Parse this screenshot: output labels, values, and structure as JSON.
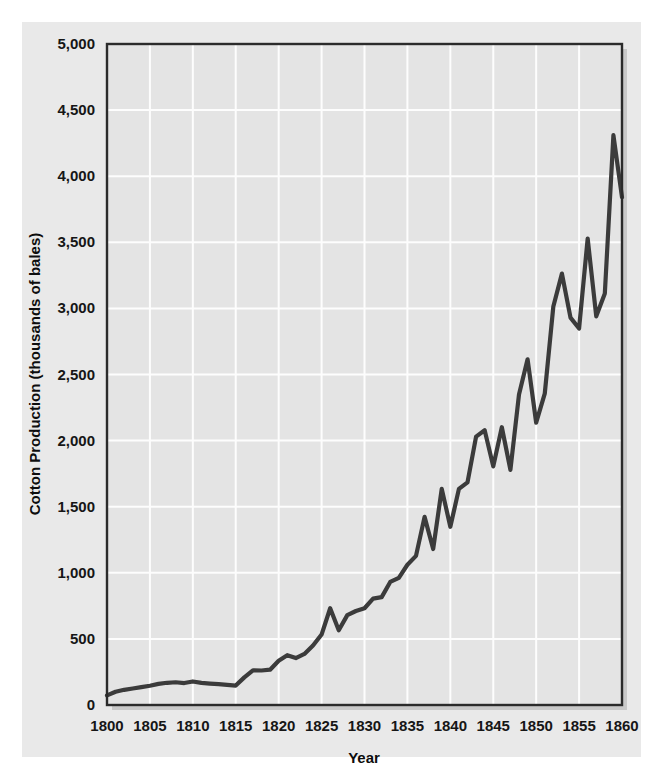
{
  "figure": {
    "background_color": "#ffffff",
    "panel_color": "#e9e9e9",
    "plot_background_color": "#e4e4e4",
    "gridline_color": "#fdfdfd",
    "frame_color": "#2b2b2b",
    "line_color": "#3b3b3b",
    "text_color": "#161616"
  },
  "chart_data": {
    "type": "line",
    "title": "",
    "subtitle": "",
    "xlabel": "Year",
    "ylabel": "Cotton Production (thousands of bales)",
    "xlim": [
      1800,
      1860
    ],
    "ylim": [
      0,
      5000
    ],
    "grid": true,
    "legend": "none",
    "x_ticks": [
      1800,
      1805,
      1810,
      1815,
      1820,
      1825,
      1830,
      1835,
      1840,
      1845,
      1850,
      1855,
      1860
    ],
    "x_tick_labels": [
      "1800",
      "1805",
      "1810",
      "1815",
      "1820",
      "1825",
      "1830",
      "1835",
      "1840",
      "1845",
      "1850",
      "1855",
      "1860"
    ],
    "y_ticks": [
      0,
      500,
      1000,
      1500,
      2000,
      2500,
      3000,
      3500,
      4000,
      4500,
      5000
    ],
    "y_tick_labels": [
      "0",
      "500",
      "1,000",
      "1,500",
      "2,000",
      "2,500",
      "3,000",
      "3,500",
      "4,000",
      "4,500",
      "5,000"
    ],
    "series": [
      {
        "name": "Cotton Production",
        "color": "#3b3b3b",
        "x": [
          1800,
          1801,
          1802,
          1803,
          1804,
          1805,
          1806,
          1807,
          1808,
          1809,
          1810,
          1811,
          1812,
          1813,
          1814,
          1815,
          1816,
          1817,
          1818,
          1819,
          1820,
          1821,
          1822,
          1823,
          1824,
          1825,
          1826,
          1827,
          1828,
          1829,
          1830,
          1831,
          1832,
          1833,
          1834,
          1835,
          1836,
          1837,
          1838,
          1839,
          1840,
          1841,
          1842,
          1843,
          1844,
          1845,
          1846,
          1847,
          1848,
          1849,
          1850,
          1851,
          1852,
          1853,
          1854,
          1855,
          1856,
          1857,
          1858,
          1859,
          1860
        ],
        "y": [
          73,
          100,
          115,
          125,
          135,
          146,
          160,
          168,
          172,
          166,
          178,
          167,
          162,
          158,
          152,
          147,
          209,
          262,
          261,
          267,
          335,
          377,
          355,
          386,
          450,
          533,
          732,
          565,
          680,
          711,
          732,
          805,
          816,
          931,
          962,
          1061,
          1128,
          1423,
          1180,
          1635,
          1348,
          1635,
          1684,
          2030,
          2078,
          1805,
          2101,
          1779,
          2348,
          2615,
          2136,
          2355,
          3015,
          3263,
          2930,
          2848,
          3528,
          2940,
          3113,
          4310,
          3841
        ]
      }
    ]
  }
}
